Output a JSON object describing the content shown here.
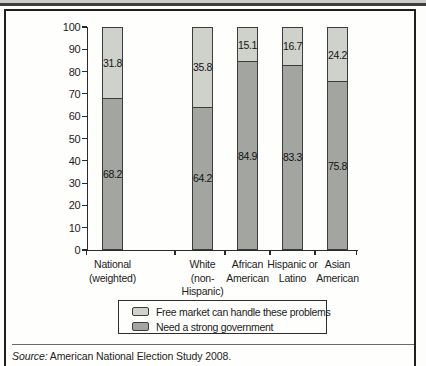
{
  "figure": {
    "source_prefix": "Source:",
    "source_text": " American National Election Study 2008."
  },
  "chart_data": {
    "type": "bar",
    "stacked": true,
    "title": "",
    "xlabel": "",
    "ylabel": "",
    "categories": [
      "National\n(weighted)",
      "White\n(non-\nHispanic)",
      "African\nAmerican",
      "Hispanic or\nLatino",
      "Asian\nAmerican"
    ],
    "series": [
      {
        "name": "Need a strong government",
        "color": "#a3a5a0",
        "values": [
          68.2,
          64.2,
          84.9,
          83.3,
          75.8
        ]
      },
      {
        "name": "Free market can handle these problems",
        "color": "#ced2ca",
        "values": [
          31.8,
          35.8,
          15.1,
          16.7,
          24.2
        ]
      }
    ],
    "ylim": [
      0,
      100
    ],
    "yticks": [
      0,
      10,
      20,
      30,
      40,
      50,
      60,
      70,
      80,
      90,
      100
    ],
    "grid": false,
    "legend_position": "bottom-box",
    "legend_order_top_to_bottom": [
      "Free market can handle these problems",
      "Need a strong government"
    ]
  },
  "colors": {
    "segment_light": "#ced2ca",
    "segment_dark": "#a3a5a0",
    "bar_border": "#3c3c3c",
    "axis": "#2a2a2a",
    "box_border": "#1f1f1f",
    "top_strip_light": "#cbccc8",
    "top_strip_dark": "#3e3e3e"
  }
}
